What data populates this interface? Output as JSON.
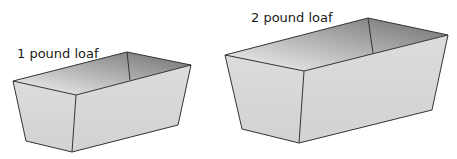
{
  "figure": {
    "pans": [
      {
        "label": "1 pound loaf",
        "label_pos": [
          17,
          58
        ],
        "vertices": {
          "rim_left": [
            13,
            81
          ],
          "rim_back": [
            127,
            52
          ],
          "rim_right": [
            191,
            65
          ],
          "rim_front": [
            76,
            95
          ],
          "inner_back_bottom": [
            130,
            80
          ],
          "base_left": [
            26,
            141
          ],
          "base_front": [
            72,
            152
          ],
          "base_right": [
            178,
            125
          ]
        }
      },
      {
        "label": "2 pound loaf",
        "label_pos": [
          251,
          22
        ],
        "vertices": {
          "rim_left": [
            225,
            55
          ],
          "rim_back": [
            368,
            18
          ],
          "rim_right": [
            448,
            35
          ],
          "rim_front": [
            304,
            71
          ],
          "inner_back_bottom": [
            373,
            53
          ],
          "base_left": [
            242,
            129
          ],
          "base_front": [
            299,
            143
          ],
          "base_right": [
            432,
            110
          ]
        }
      }
    ],
    "colors": {
      "side_fill": "#d9d9d9",
      "inner_dark": "#7a7a7a",
      "inner_light": "#f2f2f2",
      "edge": "#333333"
    }
  }
}
